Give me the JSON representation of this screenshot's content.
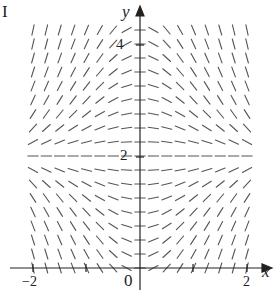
{
  "figure": {
    "panel_label": "I",
    "x_axis_label": "x",
    "y_axis_label": "y",
    "x_ticks": [
      "−2",
      "0",
      "2"
    ],
    "y_ticks": [
      "2",
      "4"
    ],
    "colors": {
      "segments": "#555555",
      "axes": "#222222"
    }
  },
  "chart_data": {
    "type": "slope_field",
    "title": "I",
    "xlabel": "x",
    "ylabel": "y",
    "xlim": [
      -2.1,
      2.4
    ],
    "ylim": [
      -0.2,
      4.4
    ],
    "x_tick_labels": [
      "-2",
      "0",
      "2"
    ],
    "y_tick_labels": [
      "2",
      "4"
    ],
    "equilibrium_line": 2,
    "grid": {
      "x_step": 0.25,
      "y_step": 0.25,
      "x_range": [
        -2,
        2
      ],
      "y_range": [
        0,
        4.25
      ]
    }
  }
}
